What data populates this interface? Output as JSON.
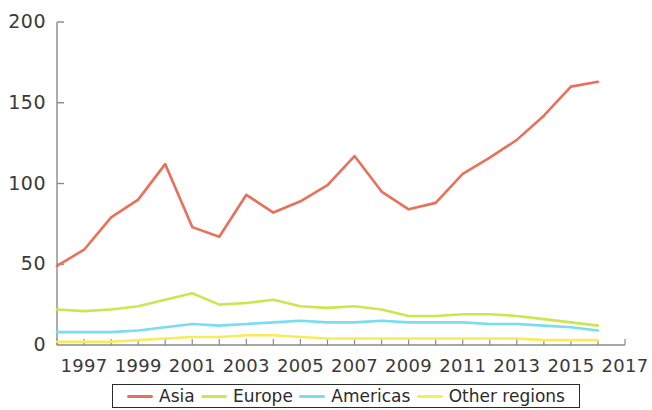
{
  "chart_data": {
    "type": "line",
    "title": "",
    "subtitle": "",
    "xlabel": "",
    "ylabel": "",
    "xlim": [
      1996,
      2017
    ],
    "ylim": [
      0,
      200
    ],
    "yticks": [
      0,
      50,
      100,
      150,
      200
    ],
    "ytick_labels": [
      "0",
      "50",
      "100",
      "150",
      "200"
    ],
    "xticks": [
      1997,
      1999,
      2001,
      2003,
      2005,
      2007,
      2009,
      2011,
      2013,
      2015,
      2017
    ],
    "xtick_labels": [
      "1997",
      "1999",
      "2001",
      "2003",
      "2005",
      "2007",
      "2009",
      "2011",
      "2013",
      "2015",
      "2017"
    ],
    "x": [
      1996,
      1997,
      1998,
      1999,
      2000,
      2001,
      2002,
      2003,
      2004,
      2005,
      2006,
      2007,
      2008,
      2009,
      2010,
      2011,
      2012,
      2013,
      2014,
      2015,
      2016
    ],
    "grid": false,
    "legend_position": "bottom",
    "series": [
      {
        "name": "Asia",
        "color": "#e8715a",
        "values": [
          49,
          59,
          79,
          90,
          112,
          73,
          67,
          93,
          82,
          89,
          99,
          117,
          95,
          84,
          88,
          106,
          116,
          127,
          142,
          160,
          163
        ]
      },
      {
        "name": "Europe",
        "color": "#cde64f",
        "values": [
          22,
          21,
          22,
          24,
          28,
          32,
          25,
          26,
          28,
          24,
          23,
          24,
          22,
          18,
          18,
          19,
          19,
          18,
          16,
          14,
          12
        ]
      },
      {
        "name": "Americas",
        "color": "#79dcf0",
        "values": [
          8,
          8,
          8,
          9,
          11,
          13,
          12,
          13,
          14,
          15,
          14,
          14,
          15,
          14,
          14,
          14,
          13,
          13,
          12,
          11,
          9
        ]
      },
      {
        "name": "Other regions",
        "color": "#f7ec5a",
        "values": [
          2,
          2,
          2,
          3,
          4,
          5,
          5,
          6,
          6,
          5,
          4,
          4,
          4,
          4,
          4,
          4,
          4,
          4,
          3,
          3,
          3
        ]
      }
    ]
  },
  "legend": {
    "items": [
      {
        "label": "Asia"
      },
      {
        "label": "Europe"
      },
      {
        "label": "Americas"
      },
      {
        "label": "Other regions"
      }
    ]
  },
  "colors": {
    "asia": "#e8715a",
    "europe": "#cde64f",
    "americas": "#79dcf0",
    "other_regions": "#f7ec5a",
    "axis": "#8a8a8a",
    "text": "#3a3a3a"
  }
}
